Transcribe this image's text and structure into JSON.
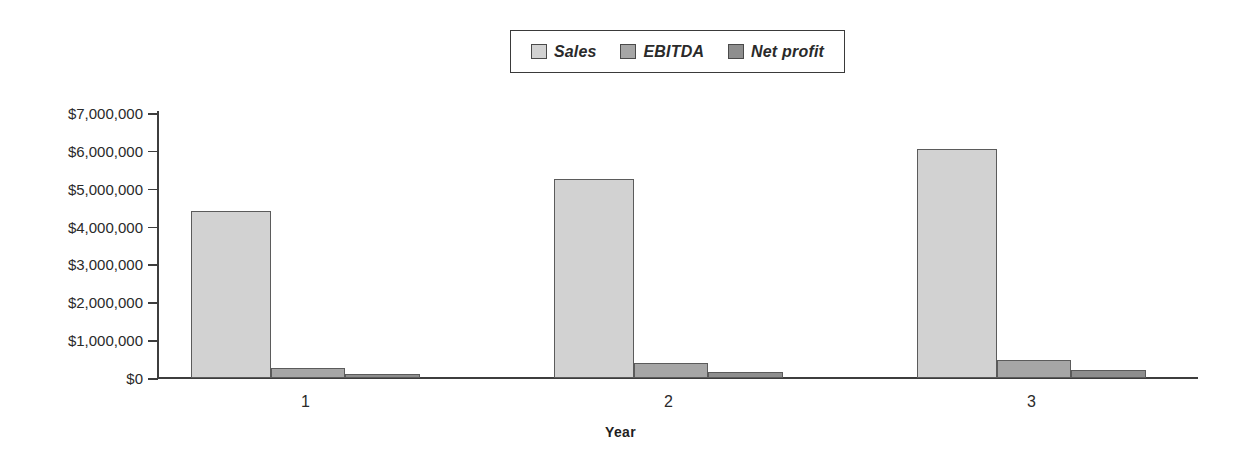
{
  "chart_data": {
    "type": "bar",
    "title": "",
    "xlabel": "Year",
    "ylabel": "",
    "categories": [
      "1",
      "2",
      "3"
    ],
    "series": [
      {
        "name": "Sales",
        "color": "#d2d2d2",
        "values": [
          4400000,
          5250000,
          6050000
        ]
      },
      {
        "name": "EBITDA",
        "color": "#a6a6a6",
        "values": [
          270000,
          390000,
          470000
        ]
      },
      {
        "name": "Net profit",
        "color": "#8e8e8e",
        "values": [
          110000,
          160000,
          200000
        ]
      }
    ],
    "ylim": [
      0,
      7000000
    ],
    "ytick_values": [
      7000000,
      6000000,
      5000000,
      4000000,
      3000000,
      2000000,
      1000000,
      0
    ],
    "ytick_labels": [
      "$7,000,000",
      "$6,000,000",
      "$5,000,000",
      "$4,000,000",
      "$3,000,000",
      "$2,000,000",
      "$1,000,000",
      "$0"
    ],
    "grid": false,
    "legend_position": "top-center",
    "legend_border_color": "#3a3a3a",
    "axis_color": "#3d3d3d",
    "background": "#ffffff"
  },
  "legend": {
    "entries": [
      {
        "label": "Sales"
      },
      {
        "label": "EBITDA"
      },
      {
        "label": "Net profit"
      }
    ]
  },
  "axes": {
    "x_title": "Year",
    "x_categories": [
      "1",
      "2",
      "3"
    ],
    "y_labels": [
      "$7,000,000",
      "$6,000,000",
      "$5,000,000",
      "$4,000,000",
      "$3,000,000",
      "$2,000,000",
      "$1,000,000",
      "$0"
    ]
  }
}
